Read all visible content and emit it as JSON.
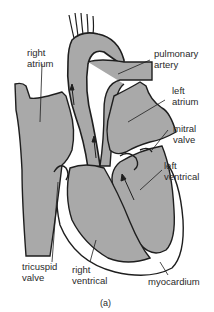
{
  "diagram": {
    "caption": "(a)",
    "colors": {
      "blood": "#a9a9a9",
      "outline": "#1e1e1e",
      "background": "#ffffff",
      "text": "#2a2a2a"
    },
    "labels": {
      "right_atrium": "right\natrium",
      "pulmonary_artery": "pulmonary\nartery",
      "left_atrium": "left\natrium",
      "mitral_valve": "mitral\nvalve",
      "left_ventrical": "left\nventrical",
      "tricuspid_valve": "tricuspid\nvalve",
      "right_ventrical": "right\nventrical",
      "myocardium": "myocardium"
    }
  }
}
